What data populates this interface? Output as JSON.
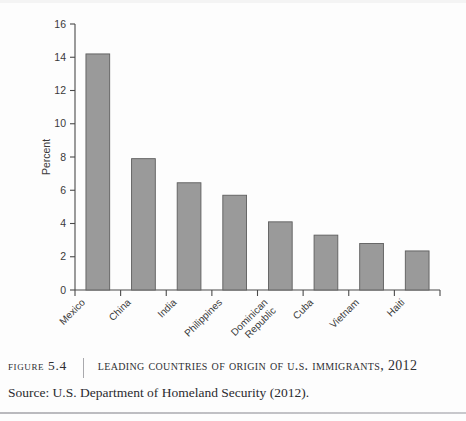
{
  "figure": {
    "number_label": "Figure 5.4",
    "title": "Leading Countries of Origin of U.S. Immigrants, 2012",
    "source": "Source: U.S. Department of Homeland Security (2012)."
  },
  "colors": {
    "bar_fill": "#9a9a9a",
    "bar_stroke": "#5e5e5e",
    "axis": "#4a4a4a",
    "text": "#3a3a3a",
    "caption_text": "#2f2f33",
    "page_background": "#fdfdfd",
    "rule": "#b9b9bd"
  },
  "chart_data": {
    "type": "bar",
    "title": "",
    "xlabel": "",
    "ylabel": "Percent",
    "ylim": [
      0,
      16
    ],
    "yticks": [
      0,
      2,
      4,
      6,
      8,
      10,
      12,
      14,
      16
    ],
    "ytick_labels": [
      "0",
      "2",
      "4",
      "6",
      "8",
      "10",
      "12",
      "14",
      "16"
    ],
    "grid": false,
    "legend": false,
    "categories": [
      "Mexico",
      "China",
      "India",
      "Philippines",
      "Dominican Republic",
      "Cuba",
      "Vietnam",
      "Haiti"
    ],
    "category_lines": [
      [
        "Mexico"
      ],
      [
        "China"
      ],
      [
        "India"
      ],
      [
        "Philippines"
      ],
      [
        "Dominican",
        "Republic"
      ],
      [
        "Cuba"
      ],
      [
        "Vietnam"
      ],
      [
        "Haiti"
      ]
    ],
    "values": [
      14.2,
      7.9,
      6.45,
      5.7,
      4.1,
      3.3,
      2.8,
      2.35
    ],
    "series": [
      {
        "name": "Percent of U.S. immigrants",
        "values": [
          14.2,
          7.9,
          6.45,
          5.7,
          4.1,
          3.3,
          2.8,
          2.35
        ]
      }
    ]
  }
}
